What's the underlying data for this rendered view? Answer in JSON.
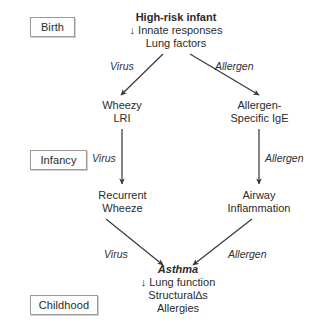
{
  "diagram": {
    "stages": [
      {
        "id": "birth",
        "label": "Birth"
      },
      {
        "id": "infancy",
        "label": "Infancy"
      },
      {
        "id": "childhood",
        "label": "Childhood"
      }
    ],
    "nodes": [
      {
        "id": "high-risk-infant",
        "heading": "High-risk infant",
        "lines": [
          "↓ Innate responses",
          "Lung factors"
        ]
      },
      {
        "id": "wheezy-lri",
        "heading": "",
        "lines": [
          "Wheezy",
          "LRI"
        ]
      },
      {
        "id": "allergen-specific-ige",
        "heading": "",
        "lines": [
          "Allergen-",
          "Specific IgE"
        ]
      },
      {
        "id": "recurrent-wheeze",
        "heading": "",
        "lines": [
          "Recurrent",
          "Wheeze"
        ]
      },
      {
        "id": "airway-inflammation",
        "heading": "",
        "lines": [
          "Airway",
          "Inflammation"
        ]
      },
      {
        "id": "asthma",
        "heading": "Asthma",
        "lines": [
          "↓ Lung function",
          "Structural∆s",
          "Allergies"
        ]
      }
    ],
    "edge_labels": [
      {
        "id": "virus-top",
        "text": "Virus"
      },
      {
        "id": "allergen-top",
        "text": "Allergen"
      },
      {
        "id": "virus-middle",
        "text": "Virus"
      },
      {
        "id": "allergen-middle",
        "text": "Allergen"
      },
      {
        "id": "virus-bottom",
        "text": "Virus"
      },
      {
        "id": "allergen-bottom",
        "text": "Allergen"
      }
    ],
    "colors": {
      "arrow": "#3a3a3a",
      "text": "#2b2b2b",
      "box_border": "#9a9a9a",
      "background": "#ffffff"
    }
  }
}
